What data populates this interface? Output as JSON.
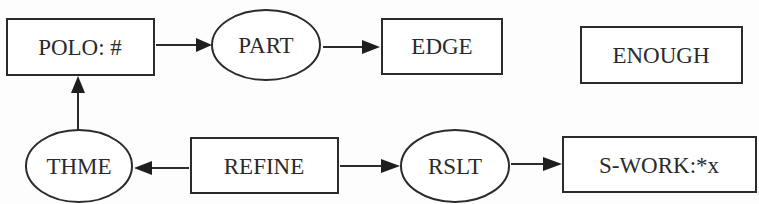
{
  "diagram": {
    "type": "flowchart",
    "nodes": [
      {
        "id": "polo",
        "label": "POLO: #",
        "shape": "rect"
      },
      {
        "id": "part",
        "label": "PART",
        "shape": "ellipse"
      },
      {
        "id": "edge",
        "label": "EDGE",
        "shape": "rect"
      },
      {
        "id": "enough",
        "label": "ENOUGH",
        "shape": "rect"
      },
      {
        "id": "thme",
        "label": "THME",
        "shape": "ellipse"
      },
      {
        "id": "refine",
        "label": "REFINE",
        "shape": "rect"
      },
      {
        "id": "rslt",
        "label": "RSLT",
        "shape": "ellipse"
      },
      {
        "id": "swork",
        "label": "S-WORK:*x",
        "shape": "rect"
      }
    ],
    "edges": [
      {
        "from": "polo",
        "to": "part"
      },
      {
        "from": "part",
        "to": "edge"
      },
      {
        "from": "thme",
        "to": "polo"
      },
      {
        "from": "refine",
        "to": "thme"
      },
      {
        "from": "refine",
        "to": "rslt"
      },
      {
        "from": "rslt",
        "to": "swork"
      }
    ],
    "colors": {
      "stroke": "#2b2b2b",
      "text": "#2a2a2a",
      "background": "#fdfdfd"
    }
  }
}
